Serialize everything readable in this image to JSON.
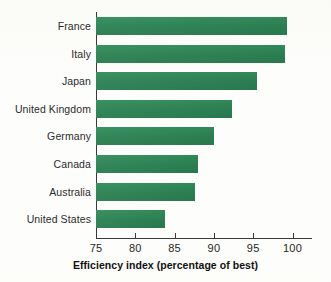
{
  "figure": {
    "background_color": "#fdfdfc",
    "bar_color": "#2e8356",
    "axis_color": "#3a3a3a",
    "label_color": "#2b2b2b"
  },
  "chart_data": {
    "type": "bar",
    "orientation": "horizontal",
    "title": "",
    "xlabel": "Efficiency index (percentage of best)",
    "ylabel": "",
    "categories": [
      "France",
      "Italy",
      "Japan",
      "United Kingdom",
      "Germany",
      "Canada",
      "Australia",
      "United States"
    ],
    "values": [
      99.3,
      99.0,
      95.5,
      92.3,
      90.0,
      88.0,
      87.6,
      83.8
    ],
    "xlim": [
      75,
      102.5
    ],
    "xticks": [
      75,
      80,
      85,
      90,
      95,
      100
    ],
    "xtick_labels": [
      "75",
      "80",
      "85",
      "90",
      "95",
      "100"
    ],
    "grid": false,
    "legend": null
  }
}
